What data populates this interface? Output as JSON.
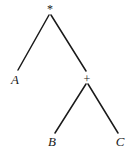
{
  "diagram": {
    "type": "expression-tree",
    "nodes": [
      {
        "id": "root",
        "label": "*",
        "kind": "operator",
        "x": 50,
        "y": 13
      },
      {
        "id": "a",
        "label": "A",
        "kind": "operand",
        "x": 15,
        "y": 82
      },
      {
        "id": "plus",
        "label": "+",
        "kind": "operator",
        "x": 87,
        "y": 80
      },
      {
        "id": "b",
        "label": "B",
        "kind": "operand",
        "x": 52,
        "y": 143
      },
      {
        "id": "c",
        "label": "C",
        "kind": "operand",
        "x": 120,
        "y": 143
      }
    ],
    "edges": [
      {
        "from": "root",
        "to": "a"
      },
      {
        "from": "root",
        "to": "plus"
      },
      {
        "from": "plus",
        "to": "b"
      },
      {
        "from": "plus",
        "to": "c"
      }
    ],
    "colors": {
      "line": "#1a1a1a",
      "text": "#1a1a1a",
      "background": "#ffffff"
    }
  }
}
